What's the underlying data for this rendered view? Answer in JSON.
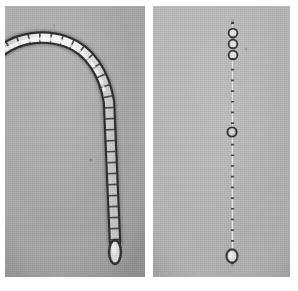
{
  "figure": {
    "kind": "light-micrograph",
    "caption": "",
    "canvas": {
      "width": 298,
      "height": 291,
      "background": "#ffffff"
    },
    "panels": [
      {
        "id": "panel-left",
        "label": "",
        "x": 5,
        "y": 6,
        "width": 140,
        "height": 271,
        "background": "#a9a9a9",
        "background_light": "#b4b4b4",
        "background_dark": "#9d9d9d",
        "specimen": {
          "name": "filamentous-cell-chain-curved",
          "description": "Filament of rod-shaped cells forming a hook: an arc entering at the left margin, curving over an apex and descending into a straight vertical chain terminating in a rounded end cell.",
          "cell_count": 26,
          "cell_width_px": 12,
          "cell_length_px": 11,
          "outline_color": "#2e2e2e",
          "lumen_color": "#ededed",
          "halo_color": "#cfcfcf",
          "terminal_cell": {
            "shape": "rounded-capsule",
            "x": 114,
            "y": 240,
            "width": 13,
            "height": 25
          }
        }
      },
      {
        "id": "panel-right",
        "label": "",
        "x": 153,
        "y": 6,
        "width": 137,
        "height": 271,
        "background": "#b5b5b5",
        "background_light": "#bfbfbf",
        "background_dark": "#aaaaaa",
        "specimen": {
          "name": "filamentous-cell-chain-straight",
          "description": "Straight vertical filament of nearly isodiametric cells with visible cross walls, slightly beaded, ending in a rounded terminal cell.",
          "cell_count": 22,
          "cell_width_px": 12,
          "cell_length_px": 11,
          "outline_color": "#3a3a3a",
          "lumen_color": "#e4e4e4",
          "halo_color": "#cccccc",
          "terminal_cell": {
            "shape": "rounded-capsule",
            "x": 229,
            "y": 243,
            "width": 13,
            "height": 15
          }
        }
      }
    ],
    "separator": {
      "name": "panel-gap",
      "x": 145,
      "width": 8,
      "color": "#ffffff"
    }
  }
}
